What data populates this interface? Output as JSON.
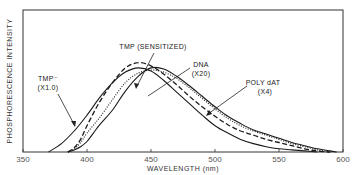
{
  "chart_data": {
    "type": "line",
    "title": "",
    "xlabel": "WAVELENGTH (nm)",
    "ylabel": "PHOSPHORESCENCE INTENSITY",
    "xlim": [
      350,
      600
    ],
    "ylim": [
      0,
      100
    ],
    "x_ticks": [
      350,
      400,
      450,
      500,
      550,
      600
    ],
    "y_ticks": [],
    "grid": false,
    "legend": "inline annotations with arrows",
    "series": [
      {
        "name": "TMP⁻ (X1.0)",
        "style": "solid",
        "x": [
          370,
          380,
          390,
          400,
          410,
          420,
          430,
          440,
          450,
          460,
          470,
          480,
          490,
          500,
          510,
          520,
          530,
          540,
          550,
          560,
          570,
          580
        ],
        "values": [
          0,
          8,
          20,
          35,
          52,
          66,
          76,
          80,
          77,
          68,
          57,
          46,
          35,
          25,
          18,
          12,
          8,
          5,
          3,
          2,
          1,
          0
        ]
      },
      {
        "name": "TMP (SENSITIZED)",
        "style": "dashed",
        "x": [
          385,
          390,
          395,
          400,
          410,
          420,
          430,
          440,
          450,
          460,
          470,
          480,
          490,
          500,
          510,
          520,
          530,
          540,
          550,
          560,
          570,
          580,
          590
        ],
        "values": [
          0,
          4,
          12,
          25,
          48,
          66,
          80,
          85,
          82,
          74,
          64,
          53,
          43,
          34,
          26,
          20,
          16,
          12,
          9,
          6,
          3,
          1,
          0
        ]
      },
      {
        "name": "DNA (X20)",
        "style": "dotted",
        "x": [
          385,
          390,
          395,
          400,
          410,
          420,
          430,
          440,
          450,
          460,
          470,
          480,
          490,
          500,
          510,
          520,
          530,
          540,
          550,
          560,
          570,
          580,
          590
        ],
        "values": [
          0,
          3,
          9,
          18,
          33,
          50,
          66,
          75,
          78,
          76,
          70,
          61,
          51,
          41,
          32,
          25,
          20,
          16,
          12,
          8,
          5,
          2,
          0
        ]
      },
      {
        "name": "POLY dAT (X4)",
        "style": "solid",
        "x": [
          385,
          390,
          395,
          400,
          405,
          410,
          420,
          430,
          440,
          450,
          460,
          470,
          480,
          490,
          500,
          510,
          520,
          530,
          540,
          550,
          560,
          570,
          580,
          590,
          595
        ],
        "values": [
          0,
          2,
          5,
          10,
          18,
          26,
          40,
          58,
          72,
          80,
          79,
          72,
          63,
          53,
          43,
          34,
          27,
          21,
          17,
          13,
          9,
          6,
          3,
          1,
          0
        ]
      }
    ],
    "annotations": [
      {
        "line1": "TMP⁻",
        "line2": "(X1.0)",
        "target_series": "TMP⁻ (X1.0)"
      },
      {
        "line1": "TMP (SENSITIZED)",
        "line2": "",
        "target_series": "TMP (SENSITIZED)"
      },
      {
        "line1": "DNA",
        "line2": "(X20)",
        "target_series": "DNA (X20)"
      },
      {
        "line1": "POLY dAT",
        "line2": "(X4)",
        "target_series": "POLY dAT (X4)"
      }
    ]
  }
}
